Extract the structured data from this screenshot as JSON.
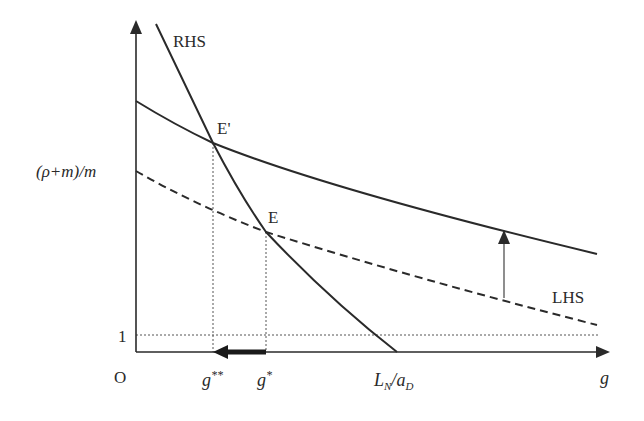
{
  "diagram": {
    "title": "",
    "colors": {
      "ink": "#2a2a2a",
      "background": "#ffffff"
    },
    "axes": {
      "origin_label": "O",
      "x_label": "g",
      "y_tick_upper": "(ρ+m)/m",
      "y_tick_lower": "1"
    },
    "curves": {
      "rhs_label": "RHS",
      "lhs_label": "LHS",
      "lhs_new_style": "solid",
      "lhs_old_style": "dashed"
    },
    "points": {
      "e_prime": "E'",
      "e": "E"
    },
    "x_ticks": {
      "g_double_star": {
        "base": "g",
        "sup": "**"
      },
      "g_star": {
        "base": "g",
        "sup": "*"
      },
      "ln_ad": {
        "L": "L",
        "L_sub": "N",
        "slash": "/",
        "a": "a",
        "a_sub": "D"
      }
    },
    "annotations": {
      "shift_arrow": "upward shift of LHS curve",
      "movement_arrow": "g decreases from g* to g**"
    }
  }
}
